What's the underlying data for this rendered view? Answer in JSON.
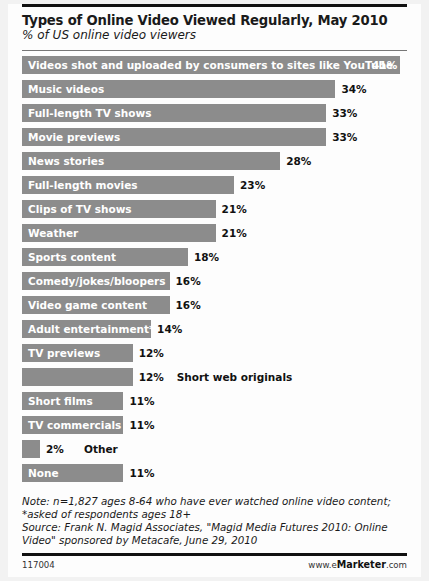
{
  "header": {
    "title": "Types of Online Video Viewed Regularly, May 2010",
    "subtitle": "% of US online video viewers"
  },
  "notes": {
    "note_line1": "Note: n=1,827 ages 8-64 who have ever watched online video content;",
    "note_line2": "*asked of respondents ages 18+",
    "source_line1": "Source: Frank N. Magid Associates, \"Magid Media Futures 2010: Online",
    "source_line2": "Video\" sponsored by Metacafe, June 29, 2010"
  },
  "footer": {
    "id": "117004",
    "brand_prefix": "www.e",
    "brand_name": "Marketer",
    "brand_suffix": ".com"
  },
  "colors": {
    "bar": "#8c8c8c",
    "card": "#fdfdfd",
    "page": "#f2f2f2",
    "rule": "#111111",
    "inside_label": "#ffffff",
    "outside_label": "#111111"
  },
  "chart_data": {
    "type": "bar",
    "orientation": "horizontal",
    "title": "Types of Online Video Viewed Regularly, May 2010",
    "subtitle": "% of US online video viewers",
    "xlabel": "",
    "ylabel": "",
    "xlim": [
      0,
      41
    ],
    "grid": false,
    "legend": "none",
    "unit": "%",
    "categories": [
      "Videos shot and uploaded by consumers to sites like YouTube",
      "Music videos",
      "Full-length TV shows",
      "Movie previews",
      "News stories",
      "Full-length movies",
      "Clips of TV shows",
      "Weather",
      "Sports content",
      "Comedy/jokes/bloopers",
      "Video game content",
      "Adult entertainment*",
      "TV previews",
      "Short web originals",
      "Short films",
      "TV commercials",
      "Other",
      "None"
    ],
    "values": [
      41,
      34,
      33,
      33,
      28,
      23,
      21,
      21,
      18,
      16,
      16,
      14,
      12,
      12,
      11,
      11,
      2,
      11
    ],
    "value_labels": [
      "41%",
      "34%",
      "33%",
      "33%",
      "28%",
      "23%",
      "21%",
      "21%",
      "18%",
      "16%",
      "16%",
      "14%",
      "12%",
      "12%",
      "11%",
      "11%",
      "2%",
      "11%"
    ],
    "label_placement": [
      "inside",
      "inside",
      "inside",
      "inside",
      "inside",
      "inside",
      "inside",
      "inside",
      "inside",
      "inside",
      "inside",
      "inside",
      "inside",
      "outside",
      "inside",
      "inside",
      "outside",
      "inside"
    ],
    "value_placement": [
      "inside",
      "outside",
      "outside",
      "outside",
      "outside",
      "outside",
      "outside",
      "outside",
      "outside",
      "outside",
      "outside",
      "outside",
      "outside",
      "outside",
      "outside",
      "outside",
      "outside",
      "outside"
    ]
  }
}
